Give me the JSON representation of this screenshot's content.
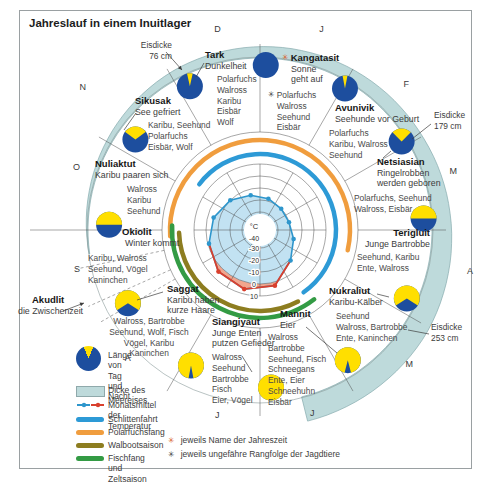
{
  "title": "Jahreslauf in einem Inuitlager",
  "scale": {
    "unit": "°C",
    "ticks": [
      "-40",
      "-30",
      "-20",
      "-10",
      "0",
      "10"
    ]
  },
  "months": [
    {
      "label": "J",
      "angle": 17,
      "r": 210
    },
    {
      "label": "F",
      "angle": 45,
      "r": 207
    },
    {
      "label": "M",
      "angle": 73,
      "r": 202
    },
    {
      "label": "A",
      "angle": 101,
      "r": 214
    },
    {
      "label": "M",
      "angle": 132,
      "r": 201
    },
    {
      "label": "J",
      "angle": 164,
      "r": 190
    },
    {
      "label": "J",
      "angle": 193,
      "r": 190
    },
    {
      "label": "A",
      "angle": 226,
      "r": 184
    },
    {
      "label": "S",
      "angle": 258,
      "r": 187
    },
    {
      "label": "O",
      "angle": 289,
      "r": 194
    },
    {
      "label": "N",
      "angle": 309,
      "r": 228
    },
    {
      "label": "D",
      "angle": 348,
      "r": 205
    }
  ],
  "seasons": [
    {
      "name": "Kangatasit",
      "subtitle": "Sonne\ngeht auf",
      "animals": "Polarfuchs\nWalross\nSeehund\nEisbär"
    },
    {
      "name": "Avunivik",
      "subtitle": "Seehunde vor Geburt",
      "animals": "Polarfuchs\nKaribu, Walross\nSeehund"
    },
    {
      "name": "Netsiasian",
      "subtitle": "Ringelrobben\nwerden geboren",
      "animals": "Polarfuchs, Seehund\nWalross, Eisbär"
    },
    {
      "name": "Terigluit",
      "subtitle": "Junge Bartrobbe",
      "animals": "Seehund, Karibu\nEnte, Walross"
    },
    {
      "name": "Nukraliut",
      "subtitle": "Karibu-Kälber",
      "animals": "Seehund\nWalross, Bartrobbe\nEnte, Kaninchen"
    },
    {
      "name": "Mannit",
      "subtitle": "Eier",
      "animals": "Walross\nBartrobbe\nSeehund, Fisch\nSchneegans\nEnte, Eier\nSchneehuhn\nEisbär"
    },
    {
      "name": "Siangiyaut",
      "subtitle": "Junge Enten\nputzen Gefieder",
      "animals": "Walross\nSeehund\nBartrobbe\nFisch\nEier, Vögel"
    },
    {
      "name": "Saggat",
      "subtitle": "Karibu haben\nkurze Haare",
      "animals": "Walross, Bartrobbe\nSeehund, Wolf, Fisch\nVögel, Karibu\nKaninchen"
    },
    {
      "name": "Akudlit",
      "subtitle": "die Zwischenzeit",
      "animals": ""
    },
    {
      "name": "Okiolit",
      "subtitle": "Winter kommt",
      "animals": "Karibu, Walross\nSeehund, Vögel\nKaninchen"
    },
    {
      "name": "Nuliaktut",
      "subtitle": "Karibu paaren sich",
      "animals": "Walross\nKaribu\nSeehund"
    },
    {
      "name": "Sikusak",
      "subtitle": "See gefriert",
      "animals": "Karibu, Seehund\nPolarfuchs\nEisbär, Wolf"
    },
    {
      "name": "Tark",
      "subtitle": "Dunkelheit",
      "animals": "Polarfuchs\nWalross\nKaribu\nEisbär\nWolf"
    }
  ],
  "ice_labels": [
    {
      "label": "Eisdicke",
      "value": "76 cm"
    },
    {
      "label": "Eisdicke",
      "value": "179 cm"
    },
    {
      "label": "Eisdicke",
      "value": "253 cm"
    }
  ],
  "day_night_pies": [
    {
      "angle": 2,
      "r": 165,
      "day": 0
    },
    {
      "angle": 31,
      "r": 165,
      "day": 0.06
    },
    {
      "angle": 58,
      "r": 167,
      "day": 0.25
    },
    {
      "angle": 86,
      "r": 164,
      "day": 0.5
    },
    {
      "angle": 115,
      "r": 162,
      "day": 0.68
    },
    {
      "angle": 146,
      "r": 157,
      "day": 0.92
    },
    {
      "angle": 176,
      "r": 158,
      "day": 1
    },
    {
      "angle": 207,
      "r": 152,
      "day": 0.94
    },
    {
      "angle": 241,
      "r": 151,
      "day": 0.68
    },
    {
      "angle": 272,
      "r": 151,
      "day": 0.5
    },
    {
      "angle": 306,
      "r": 154,
      "day": 0.3
    },
    {
      "angle": 334,
      "r": 160,
      "day": 0.07
    }
  ],
  "activity_arcs": [
    {
      "name": "Schlittenfahrt",
      "color_key": "schlittenfahrt",
      "start_deg": 307,
      "end_deg": 505,
      "radius": 76
    },
    {
      "name": "Polarfuchsfang",
      "color_key": "polarfuchsfang",
      "start_deg": 266,
      "end_deg": 463,
      "radius": 90
    },
    {
      "name": "Walbootsaison",
      "color_key": "walbootsaison",
      "start_deg": 152,
      "end_deg": 268,
      "radius": 81
    },
    {
      "name": "Fischfang und Zeltsaison",
      "color_key": "fischfang",
      "start_deg": 142,
      "end_deg": 273,
      "radius": 88
    }
  ],
  "chart_data": {
    "type": "radar",
    "unit": "°C",
    "radial_ticks": [
      -40,
      -30,
      -20,
      -10,
      0,
      10
    ],
    "categories": [
      "J",
      "F",
      "M",
      "A",
      "M",
      "J",
      "J",
      "A",
      "S",
      "O",
      "N",
      "D"
    ],
    "monthly_mean_temp_c": [
      -18,
      -20,
      -20,
      -16,
      -9,
      3,
      6,
      4,
      -1,
      -5,
      -10,
      -15
    ],
    "sea_ice_thickness_cm": {
      "Nov/Dez": 76,
      "Feb/Mär": 179,
      "Mai": 253
    }
  },
  "legend": {
    "items": [
      {
        "label": "Länge von Tag\nund Nacht",
        "type": "pie"
      },
      {
        "label": "Dicke des Meereises",
        "type": "band"
      },
      {
        "label": "Monatsmittel der Temperatur",
        "type": "temp"
      },
      {
        "label": "Schlittenfahrt",
        "type": "line",
        "color_key": "schlittenfahrt"
      },
      {
        "label": "Polarfuchsfang",
        "type": "line",
        "color_key": "polarfuchsfang"
      },
      {
        "label": "Walbootsaison",
        "type": "line",
        "color_key": "walbootsaison"
      },
      {
        "label": "Fischfang und Zeltsaison",
        "type": "line",
        "color_key": "fischfang"
      }
    ],
    "notes": [
      {
        "symbol": "✳",
        "color_key": "season_marker",
        "text": "jeweils Name der Jahreszeit"
      },
      {
        "symbol": "✳",
        "color_key": "text_dark",
        "text": "jeweils ungefähre Rangfolge der Jagdtiere"
      }
    ]
  },
  "markers": {
    "season_symbol": "✳",
    "rank_symbol": "✳"
  },
  "colors": {
    "navy": "#1d4e9e",
    "yellow": "#ffdf00",
    "sea_ice_band": "#bedadb",
    "sea_ice_edge": "#85abad",
    "temp_fill": "#c2e2f2",
    "warm_fill": "#f2a58d",
    "temp_line_cold": "#2e96cc",
    "temp_line_warm": "#d9402e",
    "schlittenfahrt": "#2d9ad6",
    "polarfuchsfang": "#f09d3e",
    "walbootsaison": "#8d7d20",
    "fischfang": "#339b44",
    "season_marker": "#d95f2b",
    "text_dark": "#3d3d3d",
    "grid": "#4f4f4f"
  }
}
